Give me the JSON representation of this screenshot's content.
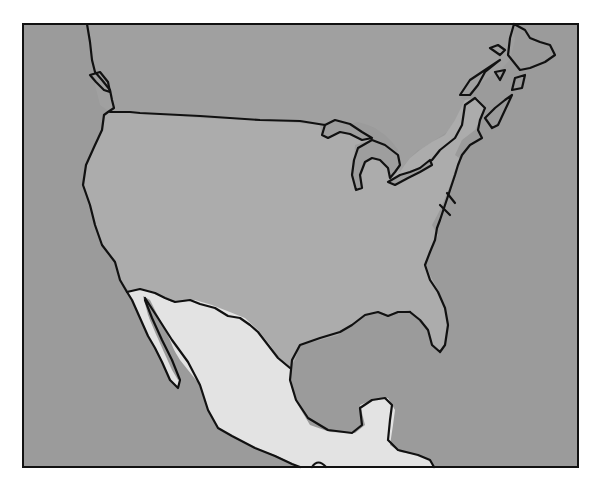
{
  "map": {
    "title": "",
    "style": "hand-drawn outline map, grayscale",
    "regions": [
      {
        "name": "Canada (southern portion)",
        "fill": "#a0a0a0"
      },
      {
        "name": "United States (contiguous)",
        "fill": "#acacac"
      },
      {
        "name": "Mexico",
        "fill": "#e3e3e3"
      },
      {
        "name": "Pacific Ocean",
        "fill": "#9b9b9b"
      },
      {
        "name": "Atlantic Ocean",
        "fill": "#9b9b9b"
      },
      {
        "name": "Gulf of Mexico",
        "fill": "#9b9b9b"
      },
      {
        "name": "Great Lakes",
        "fill": "#9e9e9e"
      }
    ],
    "labels": [],
    "colors": {
      "outline": "#111111",
      "background": "#ffffff"
    }
  }
}
